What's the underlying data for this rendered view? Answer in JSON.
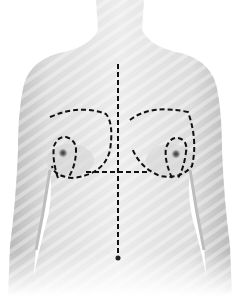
{
  "figure": {
    "markings": [
      "midline",
      "breast-outline-left",
      "breast-outline-right",
      "areola-keyhole-left",
      "areola-keyhole-right",
      "inframammary-line"
    ],
    "colors": {
      "skin_light": "#e9e9e9",
      "skin_mid": "#cfcfcf",
      "skin_dark": "#a8a8a8",
      "stripe": "#f4f4f4",
      "marking": "#111111"
    }
  }
}
